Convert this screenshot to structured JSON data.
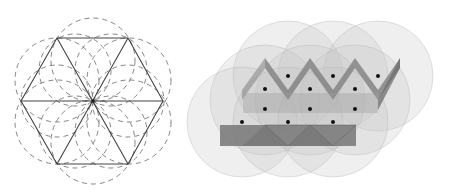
{
  "figures": [
    {
      "id": "hexagon-construction",
      "description": "Regular hexagon split into six equilateral triangles with dashed construction circles",
      "stroke_color": "#555555",
      "dash_color": "#666666"
    },
    {
      "id": "sphere-packing-zigzag",
      "description": "Translucent overlapping spheres around a zigzag wall structure with lattice points",
      "sphere_color": "#bdbdbd",
      "wall_color": "#6e6e6e",
      "dot_color": "#111111",
      "dot_count": 12
    }
  ]
}
